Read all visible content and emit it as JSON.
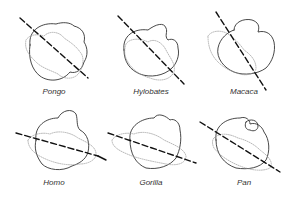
{
  "figure": {
    "panels": [
      {
        "label": "Pongo"
      },
      {
        "label": "Hylobates"
      },
      {
        "label": "Macaca"
      },
      {
        "label": "Homo"
      },
      {
        "label": "Gorilla"
      },
      {
        "label": "Pan"
      }
    ],
    "colors": {
      "outline": "#222222",
      "dotted": "#999999",
      "axis": "#111111"
    }
  }
}
